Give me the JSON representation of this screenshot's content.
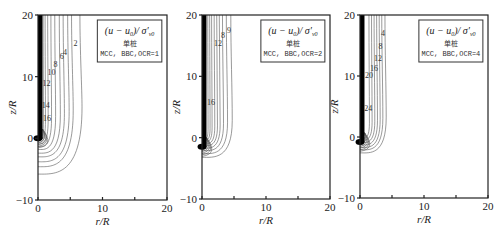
{
  "chart_data": [
    {
      "type": "contour",
      "panel": "a",
      "title": "(u-u0)/σ'v0",
      "legend": {
        "formula": "(u − u",
        "sub0": "0",
        "formula2": ")/ σ′",
        "sub": "v0",
        "line1": "单桩",
        "line2": "MCC, BBC,OCR=1"
      },
      "xlabel": "r/R",
      "ylabel": "z/R",
      "xlim": [
        0,
        20
      ],
      "ylim": [
        -10,
        20
      ],
      "xticks": [
        "0",
        "10",
        "20"
      ],
      "yticks": [
        "-10",
        "0",
        "10",
        "20"
      ],
      "contour_labels": [
        "2",
        "4",
        "6",
        "8",
        "10",
        "12",
        "14",
        "16"
      ],
      "label_positions": [
        [
          5.8,
          15.0
        ],
        [
          4.2,
          13.5
        ],
        [
          3.7,
          12.8
        ],
        [
          2.7,
          11.6
        ],
        [
          2.1,
          10.2
        ],
        [
          1.3,
          8.5
        ],
        [
          1.2,
          5.0
        ],
        [
          1.4,
          2.8
        ]
      ],
      "contours_r_at_top": [
        6.5,
        5.2,
        4.6,
        3.9,
        3.3,
        2.6,
        2.0,
        1.5,
        1.1,
        0.8
      ],
      "contours_bottom_z": [
        -5.8,
        -4.6,
        -3.8,
        -3.0,
        -2.4,
        -1.8,
        -1.3,
        -0.9,
        -0.6,
        -0.3
      ],
      "pile": {
        "r": 0.7,
        "z_tip": 0
      }
    },
    {
      "type": "contour",
      "panel": "b",
      "title": "(u-u0)/σ'v0",
      "legend": {
        "formula": "(u − u",
        "sub0": "0",
        "formula2": ")/ σ′",
        "sub": "v0",
        "line1": "单桩",
        "line2": "MCC, BBC,OCR=2"
      },
      "xlabel": "r/R",
      "ylabel": "z/R",
      "xlim": [
        0,
        20
      ],
      "ylim": [
        -10,
        20
      ],
      "xticks": [
        "0",
        "10",
        "20"
      ],
      "yticks": [
        "-10",
        "0",
        "10",
        "20"
      ],
      "contour_labels": [
        "9",
        "8",
        "12",
        "16"
      ],
      "label_positions": [
        [
          4.2,
          17.0
        ],
        [
          3.3,
          16.3
        ],
        [
          2.5,
          15.0
        ],
        [
          1.4,
          5.4
        ]
      ],
      "contours_r_at_top": [
        4.5,
        3.8,
        3.2,
        2.7,
        2.3,
        1.9,
        1.5,
        1.2,
        0.9
      ],
      "contours_bottom_z": [
        -3.2,
        -2.6,
        -2.1,
        -1.7,
        -1.3,
        -1.0,
        -0.7,
        -0.4,
        -0.2
      ],
      "pile": {
        "r": 0.7,
        "z_tip": -1.5
      }
    },
    {
      "type": "contour",
      "panel": "c",
      "title": "(u-u0)/σ'v0",
      "legend": {
        "formula": "(u − u",
        "sub0": "0",
        "formula2": ")/ σ′",
        "sub": "v0",
        "line1": "单桩",
        "line2": "MCC, BBC,OCR=4"
      },
      "xlabel": "r/R",
      "ylabel": "z/R",
      "xlim": [
        0,
        20
      ],
      "ylim": [
        -10,
        20
      ],
      "xticks": [
        "0",
        "10",
        "20"
      ],
      "yticks": [
        "-10",
        "0",
        "10",
        "20"
      ],
      "contour_labels": [
        "4",
        "8",
        "12",
        "16",
        "20",
        "24"
      ],
      "label_positions": [
        [
          3.6,
          16.5
        ],
        [
          3.2,
          14.5
        ],
        [
          2.8,
          12.5
        ],
        [
          2.2,
          10.9
        ],
        [
          1.4,
          9.6
        ],
        [
          1.3,
          4.3
        ]
      ],
      "contours_r_at_top": [
        3.9,
        3.4,
        3.0,
        2.6,
        2.2,
        1.8,
        1.4
      ],
      "contours_bottom_z": [
        -2.6,
        -2.1,
        -1.7,
        -1.3,
        -0.9,
        -0.5,
        -0.2
      ],
      "pile": {
        "r": 0.7,
        "z_tip": -0.8
      }
    }
  ],
  "panels": [
    {
      "x0": 38,
      "x1": 167,
      "y0": 15,
      "y1": 200
    },
    {
      "x0": 202,
      "x1": 330,
      "y0": 15,
      "y1": 199
    },
    {
      "x0": 360,
      "x1": 488,
      "y0": 15,
      "y1": 198
    }
  ]
}
